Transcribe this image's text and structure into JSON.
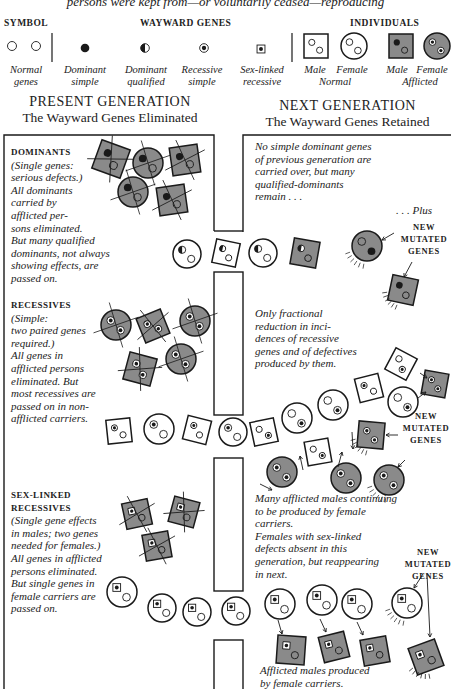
{
  "caption": "persons were kept from—or voluntarily ceased—reproducing",
  "legend": {
    "symbol_header": "SYMBOL",
    "wayward_header": "WAYWARD GENES",
    "individuals_header": "INDIVIDUALS",
    "items": [
      {
        "label1": "Normal",
        "label2": "genes"
      },
      {
        "label1": "Dominant",
        "label2": "simple"
      },
      {
        "label1": "Dominant",
        "label2": "qualified"
      },
      {
        "label1": "Recessive",
        "label2": "simple"
      },
      {
        "label1": "Sex-linked",
        "label2": "recessive"
      }
    ],
    "individuals": {
      "male": "Male",
      "female": "Female",
      "normal": "Normal",
      "male2": "Male",
      "female2": "Female",
      "afflicted": "Afflicted"
    }
  },
  "present": {
    "title": "PRESENT GENERATION",
    "subtitle": "The Wayward Genes Eliminated"
  },
  "next": {
    "title": "NEXT GENERATION",
    "subtitle": "The Wayward Genes Retained"
  },
  "dominants": {
    "heading": "DOMINANTS",
    "lines": [
      "(Single genes:",
      "serious defects.)",
      "All dominants",
      "carried by",
      "afflicted per-",
      "sons eliminated.",
      "But many qualified",
      "dominants, not always",
      "showing effects, are",
      "passed on."
    ]
  },
  "recessives": {
    "heading": "RECESSIVES",
    "lines": [
      " (Simple:",
      "two paired genes",
      "required.)",
      "All genes in",
      "afflicted persons",
      "eliminated. But",
      "most recessives are",
      "passed on in non-",
      "afflicted carriers."
    ]
  },
  "sexlinked": {
    "heading": "SEX-LINKED RECESSIVES",
    "lines": [
      "(Single gene effects",
      "in males; two genes",
      "needed for females.)",
      "All genes in afflicted",
      "persons eliminated.",
      "But single genes in",
      "female carriers are",
      "passed on."
    ]
  },
  "next_notes": {
    "dominants": [
      "No simple dominant genes",
      "of previous generation are",
      "carried over, but many",
      "qualified-dominants",
      "remain . . ."
    ],
    "plus": ". . . Plus",
    "recessives": [
      "Only fractional",
      "reduction in inci-",
      "dences of recessive",
      "genes and of defectives",
      "produced by them."
    ],
    "sexlinked": [
      "Many afflicted males continuing",
      "to be produced by female",
      "carriers.",
      "Females with sex-linked",
      "defects absent in this",
      "generation, but reappearing",
      "in next."
    ],
    "afflicted_males": [
      "Afflicted males produced",
      "by female carriers."
    ]
  },
  "new_mutated": [
    "NEW",
    "MUTATED",
    "GENES"
  ],
  "colors": {
    "ink": "#1a1a1a",
    "afflicted_fill": "#8a8a8a",
    "paper": "#ffffff"
  },
  "figures": [
    {
      "shape": "sq",
      "x": 111,
      "y": 159,
      "r": 15,
      "rot": 20,
      "aff": true,
      "g1": "dom",
      "g2": "norm",
      "x_out": true
    },
    {
      "shape": "ci",
      "x": 148,
      "y": 163,
      "r": 15,
      "aff": true,
      "g1": "dom",
      "g2": "norm",
      "x_out": true
    },
    {
      "shape": "sq",
      "x": 185,
      "y": 160,
      "r": 14,
      "rot": -8,
      "aff": true,
      "g1": "dom",
      "g2": "norm",
      "x_out": true
    },
    {
      "shape": "ci",
      "x": 133,
      "y": 192,
      "r": 15,
      "aff": true,
      "g1": "dom",
      "g2": "norm",
      "x_out": true
    },
    {
      "shape": "sq",
      "x": 172,
      "y": 200,
      "r": 14,
      "rot": -8,
      "aff": true,
      "g1": "dom",
      "g2": "norm",
      "x_out": true
    },
    {
      "shape": "ci",
      "x": 187,
      "y": 254,
      "r": 14,
      "aff": false,
      "g1": "qual",
      "g2": "norm"
    },
    {
      "shape": "sq",
      "x": 226,
      "y": 253,
      "r": 12,
      "rot": 12,
      "aff": false,
      "g1": "qual",
      "g2": "norm"
    },
    {
      "shape": "ci",
      "x": 263,
      "y": 253,
      "r": 14,
      "aff": false,
      "g1": "qual",
      "g2": "norm"
    },
    {
      "shape": "sq",
      "x": 305,
      "y": 253,
      "r": 13,
      "rot": 10,
      "aff": true,
      "g1": "qual",
      "g2": "norm"
    },
    {
      "shape": "ci",
      "x": 367,
      "y": 246,
      "r": 15,
      "aff": true,
      "g1": "norm",
      "g2": "dom",
      "mut": true
    },
    {
      "shape": "sq",
      "x": 403,
      "y": 290,
      "r": 13,
      "rot": 12,
      "aff": true,
      "g1": "dom",
      "g2": "norm",
      "mut": true
    },
    {
      "shape": "ci",
      "x": 116,
      "y": 325,
      "r": 15,
      "aff": true,
      "g1": "rec",
      "g2": "rec",
      "x_out": true
    },
    {
      "shape": "sq",
      "x": 153,
      "y": 326,
      "r": 13,
      "rot": -22,
      "aff": true,
      "g1": "rec",
      "g2": "rec",
      "x_out": true
    },
    {
      "shape": "ci",
      "x": 195,
      "y": 321,
      "r": 15,
      "aff": true,
      "g1": "rec",
      "g2": "rec",
      "x_out": true
    },
    {
      "shape": "sq",
      "x": 140,
      "y": 369,
      "r": 14,
      "rot": 15,
      "aff": true,
      "g1": "rec",
      "g2": "rec",
      "x_out": true
    },
    {
      "shape": "ci",
      "x": 181,
      "y": 359,
      "r": 15,
      "aff": true,
      "g1": "rec",
      "g2": "rec",
      "x_out": true
    },
    {
      "shape": "sq",
      "x": 119,
      "y": 431,
      "r": 12,
      "rot": -6,
      "aff": false,
      "g1": "rec",
      "g2": "norm"
    },
    {
      "shape": "ci",
      "x": 159,
      "y": 429,
      "r": 15,
      "aff": false,
      "g1": "rec",
      "g2": "norm"
    },
    {
      "shape": "sq",
      "x": 197,
      "y": 430,
      "r": 12,
      "rot": 14,
      "aff": false,
      "g1": "rec",
      "g2": "norm"
    },
    {
      "shape": "ci",
      "x": 233,
      "y": 432,
      "r": 14,
      "aff": false,
      "g1": "rec",
      "g2": "norm"
    },
    {
      "shape": "sq",
      "x": 264,
      "y": 432,
      "r": 12,
      "rot": -12,
      "aff": false,
      "g1": "norm",
      "g2": "rec"
    },
    {
      "shape": "ci",
      "x": 297,
      "y": 418,
      "r": 15,
      "aff": false,
      "g1": "norm",
      "g2": "rec"
    },
    {
      "shape": "sq",
      "x": 318,
      "y": 452,
      "r": 12,
      "rot": -10,
      "aff": false,
      "g1": "norm",
      "g2": "rec"
    },
    {
      "shape": "ci",
      "x": 333,
      "y": 405,
      "r": 15,
      "aff": false,
      "g1": "norm",
      "g2": "rec"
    },
    {
      "shape": "sq",
      "x": 369,
      "y": 388,
      "r": 12,
      "rot": -14,
      "aff": false,
      "g1": "rec",
      "g2": "norm"
    },
    {
      "shape": "sq",
      "x": 401,
      "y": 364,
      "r": 12,
      "rot": 28,
      "aff": false,
      "g1": "norm",
      "g2": "rec"
    },
    {
      "shape": "ci",
      "x": 403,
      "y": 402,
      "r": 15,
      "aff": false,
      "g1": "norm",
      "g2": "rec"
    },
    {
      "shape": "sq",
      "x": 435,
      "y": 384,
      "r": 12,
      "rot": 10,
      "aff": true,
      "g1": "rec",
      "g2": "rec"
    },
    {
      "shape": "sq",
      "x": 371,
      "y": 435,
      "r": 13,
      "rot": 5,
      "aff": true,
      "g1": "rec",
      "g2": "rec",
      "mut": true
    },
    {
      "shape": "ci",
      "x": 282,
      "y": 472,
      "r": 15,
      "aff": true,
      "g1": "rec",
      "g2": "rec"
    },
    {
      "shape": "ci",
      "x": 346,
      "y": 478,
      "r": 15,
      "aff": true,
      "g1": "rec",
      "g2": "rec"
    },
    {
      "shape": "ci",
      "x": 389,
      "y": 480,
      "r": 15,
      "aff": true,
      "g1": "rec",
      "g2": "rec",
      "mut": true
    },
    {
      "shape": "sq",
      "x": 137,
      "y": 514,
      "r": 13,
      "rot": -12,
      "aff": true,
      "g1": "sex",
      "g2": "norm",
      "x_out": true
    },
    {
      "shape": "sq",
      "x": 184,
      "y": 512,
      "r": 13,
      "rot": 15,
      "aff": true,
      "g1": "sex",
      "g2": "norm",
      "x_out": true
    },
    {
      "shape": "sq",
      "x": 157,
      "y": 546,
      "r": 13,
      "rot": -10,
      "aff": true,
      "g1": "sex",
      "g2": "norm",
      "x_out": true
    },
    {
      "shape": "ci",
      "x": 122,
      "y": 592,
      "r": 15,
      "aff": false,
      "g1": "sex",
      "g2": "norm"
    },
    {
      "shape": "ci",
      "x": 162,
      "y": 608,
      "r": 14,
      "aff": false,
      "g1": "sex",
      "g2": "norm"
    },
    {
      "shape": "ci",
      "x": 197,
      "y": 612,
      "r": 14,
      "aff": false,
      "g1": "sex",
      "g2": "norm"
    },
    {
      "shape": "ci",
      "x": 236,
      "y": 611,
      "r": 14,
      "aff": false,
      "g1": "sex",
      "g2": "norm"
    },
    {
      "shape": "ci",
      "x": 280,
      "y": 604,
      "r": 15,
      "aff": false,
      "g1": "sex",
      "g2": "norm"
    },
    {
      "shape": "ci",
      "x": 322,
      "y": 600,
      "r": 15,
      "aff": false,
      "g1": "sex",
      "g2": "norm"
    },
    {
      "shape": "ci",
      "x": 357,
      "y": 604,
      "r": 15,
      "aff": false,
      "g1": "sex",
      "g2": "norm"
    },
    {
      "shape": "ci",
      "x": 407,
      "y": 603,
      "r": 15,
      "aff": false,
      "g1": "sex",
      "g2": "norm",
      "mut": true
    },
    {
      "shape": "sq",
      "x": 291,
      "y": 650,
      "r": 14,
      "rot": 4,
      "aff": true,
      "g1": "sex",
      "g2": "norm"
    },
    {
      "shape": "sq",
      "x": 334,
      "y": 647,
      "r": 13,
      "rot": -14,
      "aff": true,
      "g1": "sex",
      "g2": "norm"
    },
    {
      "shape": "sq",
      "x": 375,
      "y": 651,
      "r": 13,
      "rot": -10,
      "aff": true,
      "g1": "sex",
      "g2": "norm"
    },
    {
      "shape": "sq",
      "x": 426,
      "y": 657,
      "r": 14,
      "rot": -20,
      "aff": true,
      "g1": "sex",
      "g2": "norm",
      "mut": true
    }
  ],
  "arrows": [
    [
      394,
      233,
      382,
      240
    ],
    [
      412,
      262,
      404,
      277
    ],
    [
      260,
      484,
      272,
      490
    ],
    [
      303,
      470,
      300,
      456
    ],
    [
      338,
      467,
      342,
      452
    ],
    [
      352,
      432,
      353,
      449
    ],
    [
      420,
      373,
      427,
      378
    ],
    [
      418,
      398,
      426,
      392
    ],
    [
      398,
      435,
      386,
      435
    ],
    [
      405,
      460,
      398,
      467
    ],
    [
      278,
      620,
      282,
      634
    ],
    [
      320,
      619,
      326,
      632
    ],
    [
      357,
      622,
      363,
      635
    ],
    [
      423,
      574,
      414,
      588
    ],
    [
      427,
      574,
      430,
      637
    ]
  ]
}
